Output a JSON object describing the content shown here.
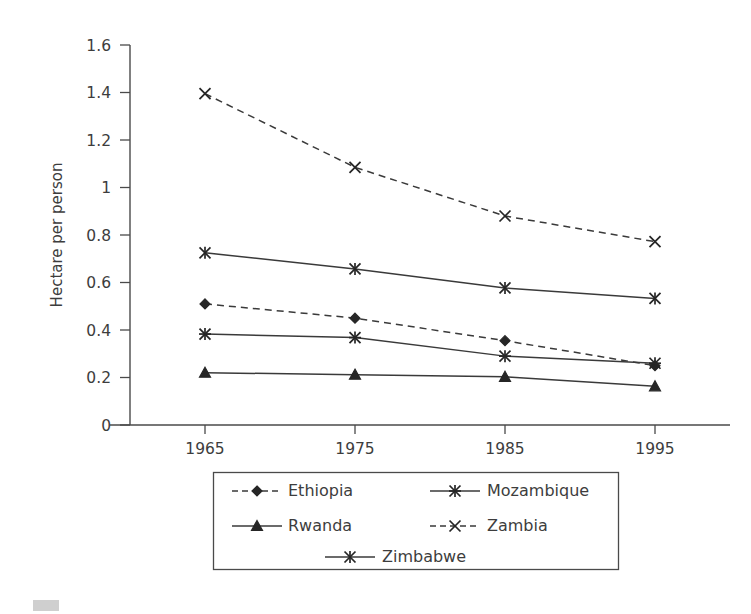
{
  "chart_data": {
    "type": "line",
    "title": "",
    "xlabel": "",
    "ylabel": "Hectare per person",
    "x": [
      1965,
      1975,
      1985,
      1995
    ],
    "categories": [
      "1965",
      "1975",
      "1985",
      "1995"
    ],
    "xlim": [
      1960,
      2000
    ],
    "ylim": [
      0,
      1.6
    ],
    "ytick_labels": [
      "0",
      "0.2",
      "0.4",
      "0.6",
      "0.8",
      "1",
      "1.2",
      "1.4",
      "1.6"
    ],
    "ytick_values": [
      0,
      0.2,
      0.4,
      0.6,
      0.8,
      1,
      1.2,
      1.4,
      1.6
    ],
    "grid": false,
    "legend_position": "bottom",
    "series": [
      {
        "name": "Ethiopia",
        "values": [
          0.51,
          0.45,
          0.355,
          0.25
        ],
        "line_style": "dashed",
        "marker": "diamond"
      },
      {
        "name": "Mozambique",
        "values": [
          0.383,
          0.368,
          0.29,
          0.26
        ],
        "line_style": "solid",
        "marker": "star"
      },
      {
        "name": "Rwanda",
        "values": [
          0.22,
          0.212,
          0.203,
          0.163
        ],
        "line_style": "solid",
        "marker": "triangle"
      },
      {
        "name": "Zambia",
        "values": [
          1.395,
          1.085,
          0.88,
          0.772
        ],
        "line_style": "dashed",
        "marker": "x"
      },
      {
        "name": "Zimbabwe",
        "values": [
          0.725,
          0.657,
          0.577,
          0.533
        ],
        "line_style": "solid",
        "marker": "asterisk"
      }
    ]
  },
  "legend": {
    "entries": [
      {
        "label": "Ethiopia"
      },
      {
        "label": "Mozambique"
      },
      {
        "label": "Rwanda"
      },
      {
        "label": "Zambia"
      },
      {
        "label": "Zimbabwe"
      }
    ]
  },
  "colors": {
    "line": "#3a3a3a",
    "axis": "#4a4a4a",
    "text": "#3d3d3d",
    "background": "#ffffff"
  }
}
